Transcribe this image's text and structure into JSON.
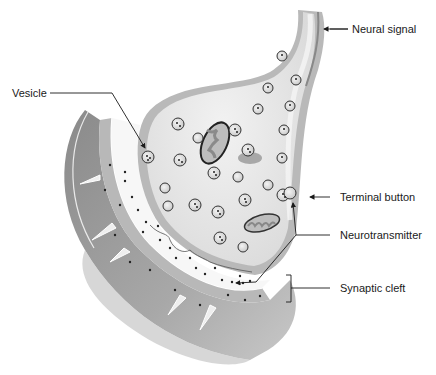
{
  "diagram": {
    "type": "anatomical-illustration",
    "labels": {
      "neural_signal": "Neural signal",
      "vesicle": "Vesicle",
      "terminal_button": "Terminal button",
      "neurotransmitter": "Neurotransmitter",
      "synaptic_cleft": "Synaptic cleft"
    },
    "colors": {
      "cytoplasm": "#e4e4e4",
      "membrane": "#b4b4b4",
      "dendrite": "#9a9a9a",
      "dendrite_shadow": "#6e6e6e",
      "cleft": "#f6f6f6",
      "ink": "#1a1a1a"
    }
  }
}
